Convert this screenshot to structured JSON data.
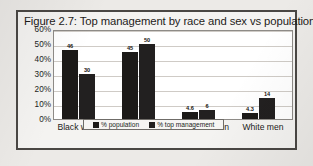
{
  "figure": {
    "border_color": "#4a4744",
    "page_background": "#eceae7"
  },
  "legend": {
    "position": "bottom-center",
    "entries": [
      {
        "label": "% population",
        "color": "#1c1a18"
      },
      {
        "label": "% top management",
        "color": "#222020"
      }
    ]
  },
  "chart_data": {
    "type": "bar",
    "title": "Figure 2.7: Top management by race and sex vs population",
    "xlabel": "",
    "ylabel": "",
    "ylim": [
      0,
      60
    ],
    "grid": true,
    "legend_position": "bottom-center",
    "value_suffix": "%",
    "categories": [
      "Black women",
      "Black men",
      "White women",
      "White men"
    ],
    "yticks": [
      "60%",
      "50%",
      "40%",
      "30%",
      "20%",
      "10%",
      "0%"
    ],
    "ytick_values": [
      60,
      50,
      40,
      30,
      20,
      10,
      0
    ],
    "series": [
      {
        "name": "% population",
        "color": "#1c1a18",
        "values": [
          46,
          45,
          4.6,
          4.3
        ],
        "labels": [
          "46",
          "45",
          "4.6",
          "4.3"
        ]
      },
      {
        "name": "% top management",
        "color": "#222020",
        "values": [
          30,
          50,
          6,
          14
        ],
        "labels": [
          "30",
          "50",
          "6",
          "14"
        ]
      }
    ]
  }
}
